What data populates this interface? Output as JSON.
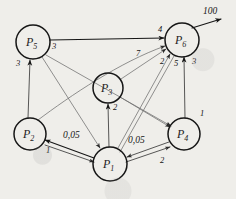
{
  "diagram": {
    "stroke_color": "#161616",
    "edge_color": "#3a3a3a",
    "background_color": "#efeeea",
    "source_flow_label": "100",
    "nodes": [
      {
        "id": "P1",
        "letter": "P",
        "index": "1",
        "cx": 110,
        "cy": 164,
        "r": 17
      },
      {
        "id": "P2",
        "letter": "P",
        "index": "2",
        "cx": 30,
        "cy": 134,
        "r": 16
      },
      {
        "id": "P3",
        "letter": "P",
        "index": "3",
        "cx": 108,
        "cy": 88,
        "r": 15
      },
      {
        "id": "P4",
        "letter": "P",
        "index": "4",
        "cx": 184,
        "cy": 134,
        "r": 16
      },
      {
        "id": "P5",
        "letter": "P",
        "index": "5",
        "cx": 33,
        "cy": 42,
        "r": 17
      },
      {
        "id": "P6",
        "letter": "P",
        "index": "6",
        "cx": 182,
        "cy": 40,
        "r": 17
      }
    ],
    "edge_labels": [
      {
        "text": "3",
        "x": 52,
        "y": 49,
        "for": "P5-P6"
      },
      {
        "text": "4",
        "x": 158,
        "y": 32,
        "for": "P5-P6-head"
      },
      {
        "text": "3",
        "x": 16,
        "y": 66,
        "for": "P2-P5"
      },
      {
        "text": "7",
        "x": 136,
        "y": 56,
        "for": "P2-P6-curve"
      },
      {
        "text": "2",
        "x": 160,
        "y": 64,
        "for": "P1-P6"
      },
      {
        "text": "5",
        "x": 174,
        "y": 66,
        "for": "P6-P1"
      },
      {
        "text": "3",
        "x": 192,
        "y": 64,
        "for": "P4-P6"
      },
      {
        "text": "2",
        "x": 113,
        "y": 110,
        "for": "P1-P3"
      },
      {
        "text": "1",
        "x": 200,
        "y": 116,
        "for": "P5-P4"
      },
      {
        "text": "1",
        "x": 46,
        "y": 153,
        "for": "P1-P2"
      },
      {
        "text": "0,05",
        "x": 63,
        "y": 138,
        "for": "P2-P1-weight",
        "big": true
      },
      {
        "text": "0,05",
        "x": 128,
        "y": 143,
        "for": "P4-P1-weight",
        "big": true
      },
      {
        "text": "2",
        "x": 160,
        "y": 163,
        "for": "P1-P4"
      }
    ]
  }
}
